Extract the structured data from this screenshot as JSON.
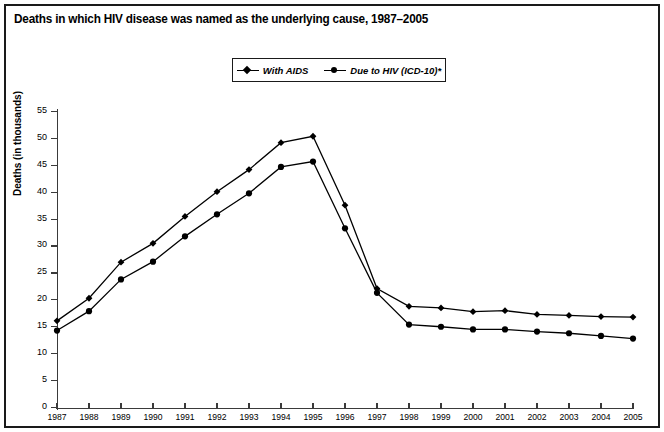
{
  "title": "Deaths in which HIV disease was named as the underlying cause, 1987–2005",
  "legend": {
    "position": "top-center",
    "entries": [
      {
        "label": "With AIDS",
        "marker": "diamond-marker-icon"
      },
      {
        "label": "Due to HIV (ICD-10)*",
        "marker": "circle-marker-icon"
      }
    ]
  },
  "axes": {
    "y_title": "Deaths (in thousands)",
    "x_title": "",
    "y_ticks": [
      "0",
      "5",
      "10",
      "15",
      "20",
      "25",
      "30",
      "35",
      "40",
      "45",
      "50",
      "55"
    ],
    "x_ticks": [
      "1987",
      "1988",
      "1989",
      "1990",
      "1991",
      "1992",
      "1993",
      "1994",
      "1995",
      "1996",
      "1997",
      "1998",
      "1999",
      "2000",
      "2001",
      "2002",
      "2003",
      "2004",
      "2005"
    ]
  },
  "colors": {
    "line": "#000000",
    "marker": "#000000",
    "axis": "#3a3a3a",
    "frame": "#1a1a1a",
    "background": "#ffffff"
  },
  "chart_data": {
    "type": "line",
    "title": "Deaths in which HIV disease was named as the underlying cause, 1987–2005",
    "xlabel": "",
    "ylabel": "Deaths (in thousands)",
    "x": [
      1987,
      1988,
      1989,
      1990,
      1991,
      1992,
      1993,
      1994,
      1995,
      1996,
      1997,
      1998,
      1999,
      2000,
      2001,
      2002,
      2003,
      2004,
      2005
    ],
    "categories": [
      "1987",
      "1988",
      "1989",
      "1990",
      "1991",
      "1992",
      "1993",
      "1994",
      "1995",
      "1996",
      "1997",
      "1998",
      "1999",
      "2000",
      "2001",
      "2002",
      "2003",
      "2004",
      "2005"
    ],
    "series": [
      {
        "name": "With AIDS",
        "marker": "diamond",
        "values": [
          16.1,
          20.3,
          27.0,
          30.5,
          35.5,
          40.1,
          44.2,
          49.2,
          50.4,
          37.6,
          22.1,
          18.8,
          18.5,
          17.8,
          18.0,
          17.3,
          17.1,
          16.9,
          16.8
        ]
      },
      {
        "name": "Due to HIV (ICD-10)*",
        "marker": "circle",
        "values": [
          14.3,
          17.9,
          23.8,
          27.1,
          31.8,
          35.9,
          39.8,
          44.7,
          45.7,
          33.3,
          21.3,
          15.4,
          15.0,
          14.5,
          14.5,
          14.1,
          13.8,
          13.3,
          12.8
        ]
      }
    ],
    "ylim": [
      0,
      55
    ],
    "ytick_step": 5,
    "grid": false,
    "legend_position": "top-center"
  }
}
